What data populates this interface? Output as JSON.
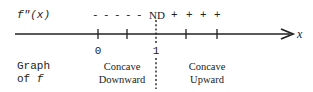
{
  "sign_row": {
    "label": "f\"(x)",
    "minus_signs": [
      "-",
      "-",
      "-",
      "-",
      "-"
    ],
    "undefined_label": "ND",
    "plus_signs": [
      "+",
      "+",
      "+",
      "+"
    ]
  },
  "axis": {
    "variable": "x",
    "tick_labels": [
      {
        "label": "0",
        "x": 98
      },
      {
        "label": "1",
        "x": 156
      }
    ],
    "tick_positions": [
      98,
      127,
      186,
      217
    ],
    "discontinuity_x": 156
  },
  "graph_row": {
    "label_line1": "Graph",
    "label_line2_prefix": "of ",
    "label_line2_var": "f",
    "intervals": [
      {
        "line1": "Concave",
        "line2": "Downward"
      },
      {
        "line1": "Concave",
        "line2": "Upward"
      }
    ]
  },
  "colors": {
    "ink": "#222222",
    "background": "#ffffff"
  }
}
